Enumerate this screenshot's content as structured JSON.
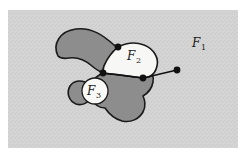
{
  "figure": {
    "canvas": {
      "width": 247,
      "height": 161
    },
    "colors": {
      "page_background": "#ffffff",
      "outer_region_fill": "#d2d2d2",
      "blob_fill": "#8d8d8d",
      "inner_white_fill": "#f6f6f4",
      "stroke": "#1a1a1a",
      "dot_fill": "#111111"
    },
    "outer_rect": {
      "x": 8,
      "y": 10,
      "width": 230,
      "height": 138
    },
    "labels": [
      {
        "id": "F1",
        "base": "F",
        "sub": "1",
        "x": 196,
        "y": 47
      },
      {
        "id": "F2",
        "base": "F",
        "sub": "2",
        "x": 131,
        "y": 58
      },
      {
        "id": "F3",
        "base": "F",
        "sub": "3",
        "x": 91,
        "y": 95
      }
    ],
    "circle_f3": {
      "cx": 95,
      "cy": 91,
      "r": 13
    },
    "dots": [
      {
        "id": "dot-top",
        "cx": 118,
        "cy": 47,
        "r": 3.2
      },
      {
        "id": "dot-left",
        "cx": 103,
        "cy": 73,
        "r": 3.2
      },
      {
        "id": "dot-middle",
        "cx": 143,
        "cy": 78,
        "r": 3.2
      },
      {
        "id": "dot-right",
        "cx": 177,
        "cy": 70,
        "r": 3.2
      }
    ],
    "segments": [
      {
        "id": "segment-left-middle",
        "x1": 103,
        "y1": 73,
        "x2": 143,
        "y2": 78
      },
      {
        "id": "segment-middle-right",
        "x1": 143,
        "y1": 78,
        "x2": 177,
        "y2": 70
      }
    ],
    "blob_path": "M 58 56 C 54 44 62 33 76 31 C 90 29 101 35 112 43 C 116 46 120 47 123 47 L 118 47 C 112 52 108 58 105 64 C 104 68 103 71 103 73 C 98 75 93 79 90 84 C 84 79 75 80 71 86 C 67 92 69 100 75 103 C 80 106 87 104 90 99 C 93 104 98 107 103 107 C 107 113 113 118 120 120 C 128 122 136 119 140 113 C 143 108 143 102 141 97 C 145 95 148 92 150 88 C 153 82 152 76 149 72 L 143 78 C 136 77 128 76 121 75 C 114 74 108 74 103 73 C 100 72 96 70 93 67 C 86 61 78 58 70 59 C 64 60 60 58 58 56 Z",
    "f2_path": "M 118 47 C 125 44 134 43 142 45 C 152 47 158 54 158 62 C 158 67 155 72 150 75 L 143 78 C 136 77 128 76 121 75 C 114 74 108 74 103 73 C 103 71 104 68 105 64 C 108 58 112 52 118 47 Z",
    "blob_outline": "M 58 56 C 52 44 60 31 76 29 C 92 27 104 36 114 45 L 118 47 C 112 52 107 59 104 66 C 103 69 103 71 103 73 C 97 76 92 80 89 85 C 83 79 74 80 70 86 C 66 93 69 101 76 104 C 82 106 88 103 91 98 C 94 104 99 108 105 108 C 109 114 115 119 122 121 C 131 123 139 119 143 112 C 146 107 145 100 143 96 C 148 93 152 88 153 82 C 154 77 152 73 149 71 L 143 78 C 136 77 128 76 121 75 C 114 74 108 74 103 73 C 99 71 95 69 92 66 C 85 60 77 57 69 58 C 63 59 60 58 58 56 Z"
  }
}
